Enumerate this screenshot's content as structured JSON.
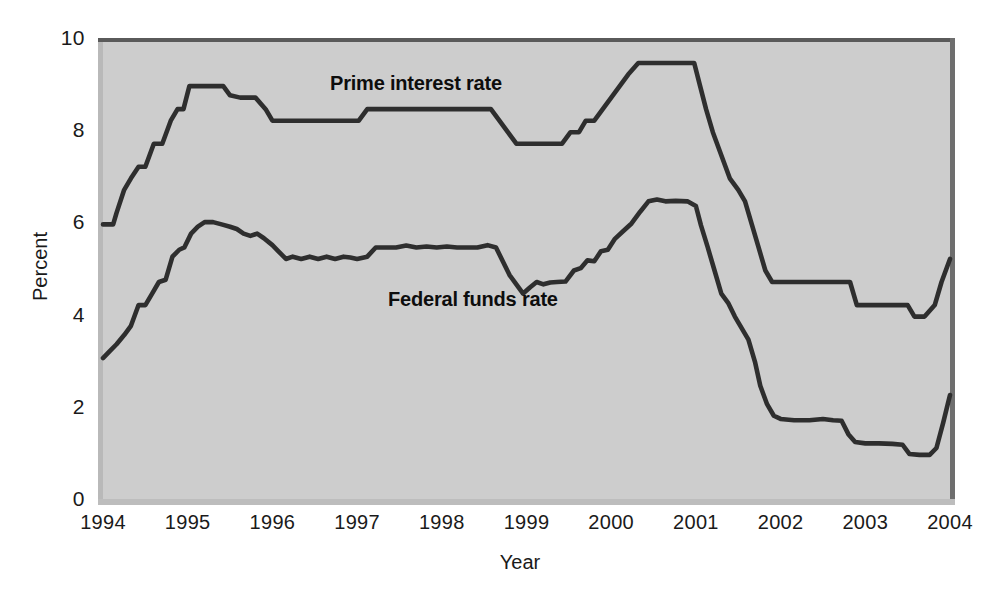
{
  "chart_data": {
    "type": "line",
    "title": "",
    "xlabel": "Year",
    "ylabel": "Percent",
    "xlim": [
      1994,
      2004
    ],
    "ylim": [
      0,
      10
    ],
    "grid": false,
    "legend_position": "inline-annotations",
    "y_ticks": [
      "0",
      "2",
      "4",
      "6",
      "8",
      "10"
    ],
    "y_tick_values": [
      0,
      2,
      4,
      6,
      8,
      10
    ],
    "x_ticks": [
      "1994",
      "1995",
      "1996",
      "1997",
      "1998",
      "1999",
      "2000",
      "2001",
      "2002",
      "2003",
      "2004"
    ],
    "x_tick_values": [
      1994,
      1995,
      1996,
      1997,
      1998,
      1999,
      2000,
      2001,
      2002,
      2003,
      2004
    ],
    "series": [
      {
        "name": "Prime interest rate",
        "label": "Prime interest rate",
        "color": "#2e2e2e",
        "points": [
          [
            1994.0,
            6.0
          ],
          [
            1994.12,
            6.0
          ],
          [
            1994.16,
            6.25
          ],
          [
            1994.25,
            6.75
          ],
          [
            1994.33,
            7.0
          ],
          [
            1994.42,
            7.25
          ],
          [
            1994.5,
            7.25
          ],
          [
            1994.6,
            7.75
          ],
          [
            1994.7,
            7.75
          ],
          [
            1994.8,
            8.25
          ],
          [
            1994.88,
            8.5
          ],
          [
            1994.95,
            8.5
          ],
          [
            1995.02,
            9.0
          ],
          [
            1995.1,
            9.0
          ],
          [
            1995.3,
            9.0
          ],
          [
            1995.42,
            9.0
          ],
          [
            1995.5,
            8.8
          ],
          [
            1995.62,
            8.75
          ],
          [
            1995.8,
            8.75
          ],
          [
            1995.92,
            8.5
          ],
          [
            1996.0,
            8.25
          ],
          [
            1996.2,
            8.25
          ],
          [
            1996.6,
            8.25
          ],
          [
            1996.92,
            8.25
          ],
          [
            1997.02,
            8.25
          ],
          [
            1997.12,
            8.5
          ],
          [
            1997.3,
            8.5
          ],
          [
            1997.6,
            8.5
          ],
          [
            1998.0,
            8.5
          ],
          [
            1998.4,
            8.5
          ],
          [
            1998.58,
            8.5
          ],
          [
            1998.68,
            8.25
          ],
          [
            1998.78,
            8.0
          ],
          [
            1998.88,
            7.75
          ],
          [
            1999.0,
            7.75
          ],
          [
            1999.2,
            7.75
          ],
          [
            1999.42,
            7.75
          ],
          [
            1999.52,
            8.0
          ],
          [
            1999.62,
            8.0
          ],
          [
            1999.7,
            8.25
          ],
          [
            1999.8,
            8.25
          ],
          [
            1999.9,
            8.5
          ],
          [
            2000.0,
            8.75
          ],
          [
            2000.1,
            9.0
          ],
          [
            2000.2,
            9.25
          ],
          [
            2000.32,
            9.5
          ],
          [
            2000.45,
            9.5
          ],
          [
            2000.7,
            9.5
          ],
          [
            2000.98,
            9.5
          ],
          [
            2001.05,
            9.0
          ],
          [
            2001.12,
            8.5
          ],
          [
            2001.2,
            8.0
          ],
          [
            2001.3,
            7.5
          ],
          [
            2001.4,
            7.0
          ],
          [
            2001.5,
            6.75
          ],
          [
            2001.58,
            6.5
          ],
          [
            2001.66,
            6.0
          ],
          [
            2001.74,
            5.5
          ],
          [
            2001.82,
            5.0
          ],
          [
            2001.9,
            4.75
          ],
          [
            2002.0,
            4.75
          ],
          [
            2002.3,
            4.75
          ],
          [
            2002.6,
            4.75
          ],
          [
            2002.82,
            4.75
          ],
          [
            2002.9,
            4.25
          ],
          [
            2003.0,
            4.25
          ],
          [
            2003.3,
            4.25
          ],
          [
            2003.5,
            4.25
          ],
          [
            2003.58,
            4.0
          ],
          [
            2003.7,
            4.0
          ],
          [
            2003.82,
            4.25
          ],
          [
            2003.9,
            4.75
          ],
          [
            2004.0,
            5.25
          ]
        ]
      },
      {
        "name": "Federal funds rate",
        "label": "Federal funds rate",
        "color": "#2e2e2e",
        "points": [
          [
            1994.0,
            3.1
          ],
          [
            1994.08,
            3.25
          ],
          [
            1994.16,
            3.4
          ],
          [
            1994.25,
            3.6
          ],
          [
            1994.33,
            3.8
          ],
          [
            1994.42,
            4.25
          ],
          [
            1994.5,
            4.25
          ],
          [
            1994.58,
            4.5
          ],
          [
            1994.66,
            4.75
          ],
          [
            1994.74,
            4.8
          ],
          [
            1994.82,
            5.3
          ],
          [
            1994.9,
            5.45
          ],
          [
            1994.96,
            5.5
          ],
          [
            1995.04,
            5.8
          ],
          [
            1995.12,
            5.95
          ],
          [
            1995.2,
            6.05
          ],
          [
            1995.3,
            6.05
          ],
          [
            1995.4,
            6.0
          ],
          [
            1995.5,
            5.95
          ],
          [
            1995.58,
            5.9
          ],
          [
            1995.66,
            5.8
          ],
          [
            1995.74,
            5.75
          ],
          [
            1995.82,
            5.8
          ],
          [
            1995.9,
            5.7
          ],
          [
            1996.0,
            5.55
          ],
          [
            1996.08,
            5.4
          ],
          [
            1996.16,
            5.25
          ],
          [
            1996.24,
            5.3
          ],
          [
            1996.34,
            5.25
          ],
          [
            1996.44,
            5.3
          ],
          [
            1996.54,
            5.25
          ],
          [
            1996.64,
            5.3
          ],
          [
            1996.74,
            5.25
          ],
          [
            1996.84,
            5.3
          ],
          [
            1996.92,
            5.28
          ],
          [
            1997.0,
            5.25
          ],
          [
            1997.12,
            5.3
          ],
          [
            1997.22,
            5.5
          ],
          [
            1997.34,
            5.5
          ],
          [
            1997.46,
            5.5
          ],
          [
            1997.58,
            5.54
          ],
          [
            1997.7,
            5.5
          ],
          [
            1997.82,
            5.52
          ],
          [
            1997.94,
            5.5
          ],
          [
            1998.06,
            5.52
          ],
          [
            1998.18,
            5.5
          ],
          [
            1998.3,
            5.5
          ],
          [
            1998.42,
            5.5
          ],
          [
            1998.54,
            5.55
          ],
          [
            1998.64,
            5.5
          ],
          [
            1998.72,
            5.2
          ],
          [
            1998.8,
            4.9
          ],
          [
            1998.88,
            4.7
          ],
          [
            1998.96,
            4.5
          ],
          [
            1999.04,
            4.63
          ],
          [
            1999.12,
            4.75
          ],
          [
            1999.2,
            4.7
          ],
          [
            1999.28,
            4.74
          ],
          [
            1999.36,
            4.75
          ],
          [
            1999.46,
            4.76
          ],
          [
            1999.56,
            5.0
          ],
          [
            1999.64,
            5.05
          ],
          [
            1999.72,
            5.22
          ],
          [
            1999.8,
            5.2
          ],
          [
            1999.88,
            5.42
          ],
          [
            1999.96,
            5.45
          ],
          [
            2000.04,
            5.68
          ],
          [
            2000.14,
            5.85
          ],
          [
            2000.24,
            6.02
          ],
          [
            2000.34,
            6.27
          ],
          [
            2000.44,
            6.5
          ],
          [
            2000.54,
            6.54
          ],
          [
            2000.64,
            6.5
          ],
          [
            2000.76,
            6.51
          ],
          [
            2000.9,
            6.5
          ],
          [
            2001.0,
            6.4
          ],
          [
            2001.06,
            5.98
          ],
          [
            2001.14,
            5.5
          ],
          [
            2001.22,
            5.0
          ],
          [
            2001.3,
            4.5
          ],
          [
            2001.38,
            4.3
          ],
          [
            2001.46,
            4.0
          ],
          [
            2001.54,
            3.75
          ],
          [
            2001.62,
            3.5
          ],
          [
            2001.7,
            3.0
          ],
          [
            2001.76,
            2.5
          ],
          [
            2001.84,
            2.1
          ],
          [
            2001.92,
            1.85
          ],
          [
            2002.0,
            1.78
          ],
          [
            2002.16,
            1.75
          ],
          [
            2002.34,
            1.75
          ],
          [
            2002.5,
            1.78
          ],
          [
            2002.62,
            1.75
          ],
          [
            2002.72,
            1.74
          ],
          [
            2002.8,
            1.45
          ],
          [
            2002.88,
            1.28
          ],
          [
            2003.0,
            1.25
          ],
          [
            2003.16,
            1.25
          ],
          [
            2003.32,
            1.24
          ],
          [
            2003.44,
            1.22
          ],
          [
            2003.52,
            1.02
          ],
          [
            2003.64,
            1.0
          ],
          [
            2003.76,
            1.0
          ],
          [
            2003.84,
            1.15
          ],
          [
            2003.92,
            1.7
          ],
          [
            2004.0,
            2.3
          ]
        ]
      }
    ],
    "annotations": [
      {
        "text": "Prime interest rate",
        "x": 1997.7,
        "y": 8.9
      },
      {
        "text": "Federal funds rate",
        "x": 1998.4,
        "y": 4.4
      }
    ]
  },
  "axes": {
    "y_title": "Percent",
    "x_title": "Year"
  },
  "colors": {
    "plot_background": "#cdcdcd",
    "line": "#2e2e2e",
    "text": "#1a1a1a",
    "page_background": "#ffffff"
  }
}
